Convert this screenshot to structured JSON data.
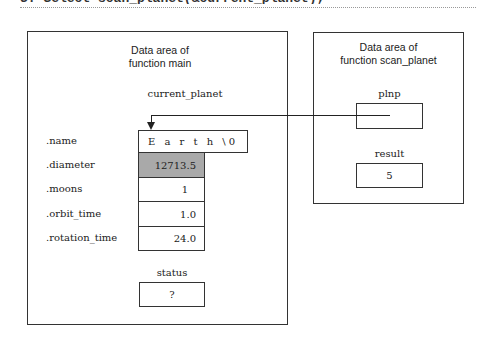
{
  "header": {
    "clipped_text": "3. Select   scan_planet(&current_planet);"
  },
  "main_area": {
    "title_line1": "Data area of",
    "title_line2": "function main",
    "struct_var": "current_planet",
    "fields": [
      {
        "label": ".name",
        "value": "E a r t h \\0"
      },
      {
        "label": ".diameter",
        "value": "12713.5",
        "highlighted": true
      },
      {
        "label": ".moons",
        "value": "1"
      },
      {
        "label": ".orbit_time",
        "value": "1.0"
      },
      {
        "label": ".rotation_time",
        "value": "24.0"
      }
    ],
    "status_label": "status",
    "status_value": "?"
  },
  "scan_area": {
    "title_line1": "Data area of",
    "title_line2": "function scan_planet",
    "plnp_label": "plnp",
    "plnp_value": "",
    "result_label": "result",
    "result_value": "5"
  },
  "colors": {
    "highlight_fill": "#a9a9a9",
    "line": "#222222"
  }
}
